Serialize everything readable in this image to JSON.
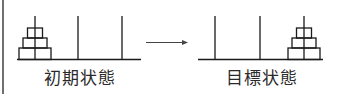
{
  "diagram": {
    "colors": {
      "stroke": "#1a1a1a",
      "background": "#ffffff",
      "text": "#2a2a2a"
    },
    "states": [
      {
        "id": "initial",
        "label": "初期状態",
        "disks_on_peg": 1,
        "disk_count": 3
      },
      {
        "id": "goal",
        "label": "目標状態",
        "disks_on_peg": 3,
        "disk_count": 3
      }
    ],
    "arrow": {
      "direction": "right",
      "meaning": "transition"
    }
  }
}
